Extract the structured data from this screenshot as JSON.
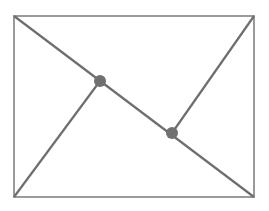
{
  "diagram": {
    "width": 269,
    "height": 211,
    "stroke_color": "#6e6e6e",
    "frame_color": "#9a9a9a",
    "point_color": "#707070",
    "rectangle": {
      "x1": 14,
      "y1": 16,
      "x2": 254,
      "y2": 197
    },
    "segments": [
      {
        "name": "diagonal",
        "from": [
          14,
          16
        ],
        "to": [
          254,
          197
        ]
      },
      {
        "name": "bottom-left-to-point-a",
        "from": [
          14,
          197
        ],
        "to": [
          100,
          81
        ]
      },
      {
        "name": "point-b-to-top-right",
        "from": [
          172,
          133
        ],
        "to": [
          254,
          16
        ]
      }
    ],
    "points": [
      {
        "name": "point-a",
        "x": 100,
        "y": 81,
        "r": 6
      },
      {
        "name": "point-b",
        "x": 172,
        "y": 133,
        "r": 6
      }
    ]
  }
}
